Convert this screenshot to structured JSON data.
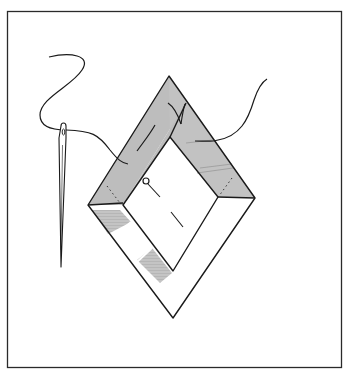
{
  "figure": {
    "title": "Sewing a mitered diamond-shaped border with needle and thread",
    "alt": "Line illustration of a diamond-shaped fabric frame with mitered corners, pinned at the center, with a threaded needle stitching the upper edges",
    "elements": {
      "frame": "outer-border-rectangle",
      "diamond": "mitered-diamond-frame",
      "needle": "sewing-needle",
      "thread": "thread",
      "pin": "straight-pin"
    },
    "colors": {
      "line": "#1a1a1a",
      "shade": "#bdbdbd",
      "background": "#ffffff"
    }
  }
}
